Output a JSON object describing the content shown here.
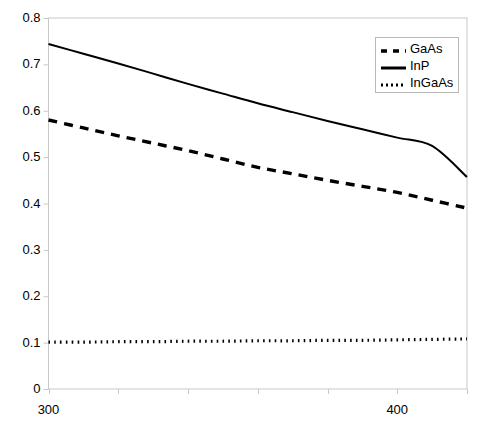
{
  "chart_data": {
    "type": "line",
    "title": "",
    "subtitle": "",
    "xlabel": "",
    "ylabel": "",
    "xlim": [
      300,
      420
    ],
    "ylim": [
      0,
      0.8
    ],
    "grid": false,
    "legend_position": "top-right",
    "x_tick_values": [
      300,
      320,
      340,
      360,
      380,
      400,
      420
    ],
    "x_tick_labels": [
      "300",
      "",
      "",
      "",
      "",
      "400",
      ""
    ],
    "y_tick_values": [
      0,
      0.1,
      0.2,
      0.3,
      0.4,
      0.5,
      0.6,
      0.7,
      0.8
    ],
    "y_tick_labels": [
      "0",
      "0.1",
      "0.2",
      "0.3",
      "0.4",
      "0.5",
      "0.6",
      "0.7",
      "0.8"
    ],
    "x": [
      300,
      310,
      320,
      330,
      340,
      350,
      360,
      370,
      380,
      390,
      400,
      410,
      420
    ],
    "series": [
      {
        "name": "GaAs",
        "style": "dashed",
        "color": "#000000",
        "values": [
          0.58,
          0.563,
          0.546,
          0.53,
          0.514,
          0.496,
          0.478,
          0.464,
          0.45,
          0.437,
          0.424,
          0.407,
          0.39
        ]
      },
      {
        "name": "InP",
        "style": "solid",
        "color": "#000000",
        "values": [
          0.744,
          0.723,
          0.702,
          0.68,
          0.658,
          0.637,
          0.616,
          0.597,
          0.578,
          0.56,
          0.542,
          0.524,
          0.457
        ]
      },
      {
        "name": "InGaAs",
        "style": "dotted",
        "color": "#000000",
        "values": [
          0.101,
          0.101,
          0.102,
          0.102,
          0.103,
          0.103,
          0.104,
          0.104,
          0.105,
          0.105,
          0.106,
          0.107,
          0.108
        ]
      }
    ]
  },
  "legend": {
    "entries": [
      {
        "label": "GaAs",
        "style": "dashed"
      },
      {
        "label": "InP",
        "style": "solid"
      },
      {
        "label": "InGaAs",
        "style": "dotted"
      }
    ]
  },
  "axes": {
    "border_color": "#c9c9c9",
    "tick_color": "#c9c9c9",
    "text_color": "#000000"
  }
}
